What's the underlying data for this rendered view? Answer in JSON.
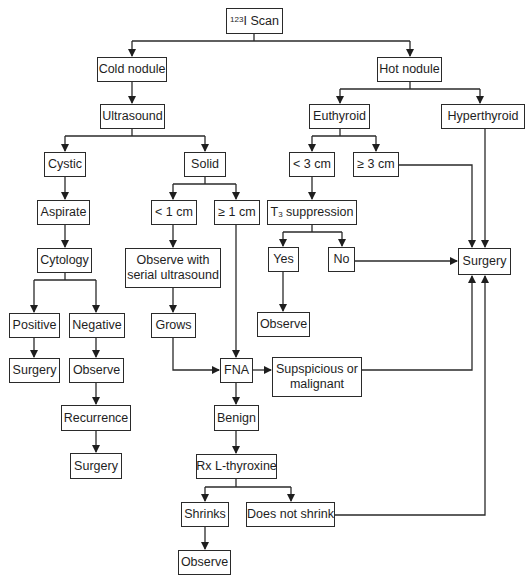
{
  "diagram": {
    "type": "flowchart",
    "nodes": {
      "scan": {
        "sup": "123",
        "label": "I Scan"
      },
      "cold": {
        "label": "Cold nodule"
      },
      "hot": {
        "label": "Hot nodule"
      },
      "ultrasound": {
        "label": "Ultrasound"
      },
      "euthyroid": {
        "label": "Euthyroid"
      },
      "hyperthyroid": {
        "label": "Hyperthyroid"
      },
      "cystic": {
        "label": "Cystic"
      },
      "solid": {
        "label": "Solid"
      },
      "lt3": {
        "label": "< 3 cm"
      },
      "ge3": {
        "label": "≥ 3 cm"
      },
      "aspirate": {
        "label": "Aspirate"
      },
      "lt1": {
        "label": "< 1 cm"
      },
      "ge1": {
        "label": "≥ 1 cm"
      },
      "t3": {
        "pre": "T",
        "sub": "3",
        "label": " suppression"
      },
      "cytology": {
        "label": "Cytology"
      },
      "observe_serial": {
        "label": "Observe with serial ultrasound"
      },
      "yes": {
        "label": "Yes"
      },
      "no": {
        "label": "No"
      },
      "surgery_main": {
        "label": "Surgery"
      },
      "positive": {
        "label": "Positive"
      },
      "negative": {
        "label": "Negative"
      },
      "grows": {
        "label": "Grows"
      },
      "observe_yes": {
        "label": "Observe"
      },
      "surgery_pos": {
        "label": "Surgery"
      },
      "observe_neg": {
        "label": "Observe"
      },
      "fna": {
        "label": "FNA"
      },
      "suspicious": {
        "label": "Supspicious or malignant"
      },
      "recurrence": {
        "label": "Recurrence"
      },
      "benign": {
        "label": "Benign"
      },
      "surgery_rec": {
        "label": "Surgery"
      },
      "rx": {
        "label": "Rx L-thyroxine"
      },
      "shrinks": {
        "label": "Shrinks"
      },
      "no_shrink": {
        "label": "Does not shrink"
      },
      "observe_shrink": {
        "label": "Observe"
      }
    },
    "edges": [
      [
        "scan",
        "cold"
      ],
      [
        "scan",
        "hot"
      ],
      [
        "cold",
        "ultrasound"
      ],
      [
        "hot",
        "euthyroid"
      ],
      [
        "hot",
        "hyperthyroid"
      ],
      [
        "ultrasound",
        "cystic"
      ],
      [
        "ultrasound",
        "solid"
      ],
      [
        "euthyroid",
        "lt3"
      ],
      [
        "euthyroid",
        "ge3"
      ],
      [
        "hyperthyroid",
        "surgery_main"
      ],
      [
        "ge3",
        "surgery_main"
      ],
      [
        "cystic",
        "aspirate"
      ],
      [
        "solid",
        "lt1"
      ],
      [
        "solid",
        "ge1"
      ],
      [
        "lt3",
        "t3"
      ],
      [
        "aspirate",
        "cytology"
      ],
      [
        "lt1",
        "observe_serial"
      ],
      [
        "t3",
        "yes"
      ],
      [
        "t3",
        "no"
      ],
      [
        "no",
        "surgery_main"
      ],
      [
        "cytology",
        "positive"
      ],
      [
        "cytology",
        "negative"
      ],
      [
        "observe_serial",
        "grows"
      ],
      [
        "yes",
        "observe_yes"
      ],
      [
        "positive",
        "surgery_pos"
      ],
      [
        "negative",
        "observe_neg"
      ],
      [
        "grows",
        "fna"
      ],
      [
        "ge1",
        "fna"
      ],
      [
        "fna",
        "suspicious"
      ],
      [
        "suspicious",
        "surgery_main"
      ],
      [
        "observe_neg",
        "recurrence"
      ],
      [
        "fna",
        "benign"
      ],
      [
        "recurrence",
        "surgery_rec"
      ],
      [
        "benign",
        "rx"
      ],
      [
        "rx",
        "shrinks"
      ],
      [
        "rx",
        "no_shrink"
      ],
      [
        "no_shrink",
        "surgery_main"
      ],
      [
        "shrinks",
        "observe_shrink"
      ]
    ]
  }
}
